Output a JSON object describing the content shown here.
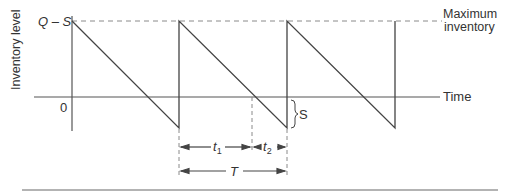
{
  "diagram": {
    "y_axis_label": "Inventory level",
    "top_level_label": "Q – S",
    "zero_label": "0",
    "time_label": "Time",
    "max_label_line1": "Maximum",
    "max_label_line2": "inventory",
    "shortage_label": "S",
    "t1_label": "t",
    "t1_sub": "1",
    "t2_label": "t",
    "t2_sub": "2",
    "cycle_label": "T"
  },
  "colors": {
    "line": "#444444",
    "dashed": "#8a8a8a",
    "separator": "#9a9a9a",
    "background": "#ffffff"
  }
}
